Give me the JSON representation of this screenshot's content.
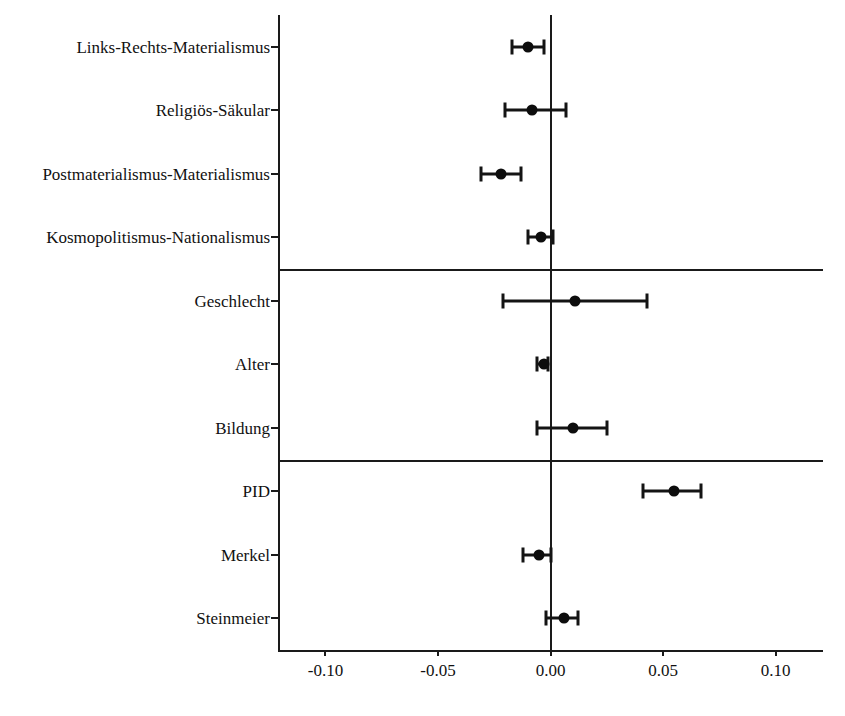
{
  "chart_data": {
    "type": "scatter",
    "subtype": "coefficient-plot",
    "title": "",
    "xlabel": "",
    "ylabel": "",
    "xlim": [
      -0.1211,
      0.1211
    ],
    "xticks": [
      -0.1,
      -0.05,
      0.0,
      0.05,
      0.1
    ],
    "xticklabels": [
      "-0.10",
      "-0.05",
      "0.00",
      "0.05",
      "0.10"
    ],
    "grid": false,
    "legend": "none",
    "reference_line": 0.0,
    "group_separators_after": [
      "Kosmopolitismus-Nationalismus",
      "Bildung"
    ],
    "categories": [
      "Links-Rechts-Materialismus",
      "Religiös-Säkular",
      "Postmaterialismus-Materialismus",
      "Kosmopolitismus-Nationalismus",
      "Geschlecht",
      "Alter",
      "Bildung",
      "PID",
      "Merkel",
      "Steinmeier"
    ],
    "values": [
      -0.01,
      -0.008,
      -0.022,
      -0.004,
      0.011,
      -0.003,
      0.01,
      0.055,
      -0.005,
      0.006
    ],
    "ci_low": [
      -0.017,
      -0.02,
      -0.031,
      -0.01,
      -0.021,
      -0.006,
      -0.006,
      0.041,
      -0.012,
      -0.002
    ],
    "ci_high": [
      -0.003,
      0.007,
      -0.013,
      0.001,
      0.043,
      -0.001,
      0.025,
      0.067,
      0.0,
      0.012
    ],
    "points": [
      {
        "label": "Links-Rechts-Materialismus",
        "estimate": -0.01,
        "ci_low": -0.017,
        "ci_high": -0.003,
        "group": 1
      },
      {
        "label": "Religiös-Säkular",
        "estimate": -0.008,
        "ci_low": -0.02,
        "ci_high": 0.007,
        "group": 1
      },
      {
        "label": "Postmaterialismus-Materialismus",
        "estimate": -0.022,
        "ci_low": -0.031,
        "ci_high": -0.013,
        "group": 1
      },
      {
        "label": "Kosmopolitismus-Nationalismus",
        "estimate": -0.004,
        "ci_low": -0.01,
        "ci_high": 0.001,
        "group": 1
      },
      {
        "label": "Geschlecht",
        "estimate": 0.011,
        "ci_low": -0.021,
        "ci_high": 0.043,
        "group": 2
      },
      {
        "label": "Alter",
        "estimate": -0.003,
        "ci_low": -0.006,
        "ci_high": -0.001,
        "group": 2
      },
      {
        "label": "Bildung",
        "estimate": 0.01,
        "ci_low": -0.006,
        "ci_high": 0.025,
        "group": 2
      },
      {
        "label": "PID",
        "estimate": 0.055,
        "ci_low": 0.041,
        "ci_high": 0.067,
        "group": 3
      },
      {
        "label": "Merkel",
        "estimate": -0.005,
        "ci_low": -0.012,
        "ci_high": 0.0,
        "group": 3
      },
      {
        "label": "Steinmeier",
        "estimate": 0.006,
        "ci_low": -0.002,
        "ci_high": 0.012,
        "group": 3
      }
    ]
  },
  "style": {
    "marker_color": "#0d0d0d",
    "axis_color": "#1a1a1a",
    "background": "#ffffff"
  }
}
